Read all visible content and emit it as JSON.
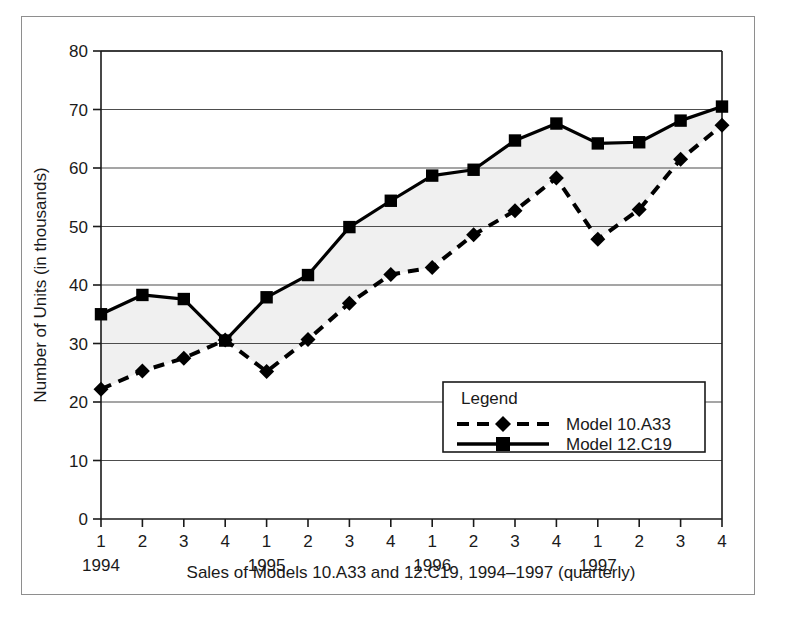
{
  "chart_data": {
    "type": "line",
    "title": "",
    "xlabel": "Sales of Models 10.A33 and 12.C19, 1994–1997 (quarterly)",
    "ylabel": "Number of Units (in thousands)",
    "ylim": [
      0,
      80
    ],
    "ytick_values": [
      0,
      10,
      20,
      30,
      40,
      50,
      60,
      70,
      80
    ],
    "ytick_labels": [
      "0",
      "10",
      "20",
      "30",
      "40",
      "50",
      "60",
      "70",
      "80"
    ],
    "grid": true,
    "grid_axis": "y",
    "legend_position": "inside-lower-right",
    "legend_title": "Legend",
    "quarter_labels": [
      "1",
      "2",
      "3",
      "4",
      "1",
      "2",
      "3",
      "4",
      "1",
      "2",
      "3",
      "4",
      "1",
      "2",
      "3",
      "4"
    ],
    "year_labels": [
      "1994",
      "1995",
      "1996",
      "1997"
    ],
    "x": [
      1,
      2,
      3,
      4,
      5,
      6,
      7,
      8,
      9,
      10,
      11,
      12,
      13,
      14,
      15,
      16
    ],
    "categories": [
      "1994 Q1",
      "1994 Q2",
      "1994 Q3",
      "1994 Q4",
      "1995 Q1",
      "1995 Q2",
      "1995 Q3",
      "1995 Q4",
      "1996 Q1",
      "1996 Q2",
      "1996 Q3",
      "1996 Q4",
      "1997 Q1",
      "1997 Q2",
      "1997 Q3",
      "1997 Q4"
    ],
    "series": [
      {
        "name": "Model 10.A33",
        "marker": "diamond",
        "linestyle": "dashed",
        "color": "#000000",
        "values": [
          22.2,
          25.3,
          27.5,
          30.6,
          25.2,
          30.7,
          36.9,
          41.8,
          43.0,
          48.6,
          52.7,
          58.3,
          47.8,
          52.9,
          61.5,
          67.3
        ]
      },
      {
        "name": "Model 12.C19",
        "marker": "square",
        "linestyle": "solid",
        "color": "#000000",
        "values": [
          35.0,
          38.3,
          37.6,
          30.5,
          37.9,
          41.7,
          49.9,
          54.4,
          58.7,
          59.7,
          64.7,
          67.6,
          64.2,
          64.4,
          68.1,
          70.5
        ]
      }
    ],
    "band_fill_color": "#f0f0f0",
    "band_description": "shaded area between Model 10.A33 and Model 12.C19"
  },
  "legend": {
    "title": "Legend",
    "entries": [
      {
        "label": "Model 10.A33"
      },
      {
        "label": "Model 12.C19"
      }
    ]
  },
  "axes": {
    "y_title": "Number of Units (in thousands)",
    "x_title": "Sales of Models 10.A33 and 12.C19, 1994–1997 (quarterly)"
  }
}
